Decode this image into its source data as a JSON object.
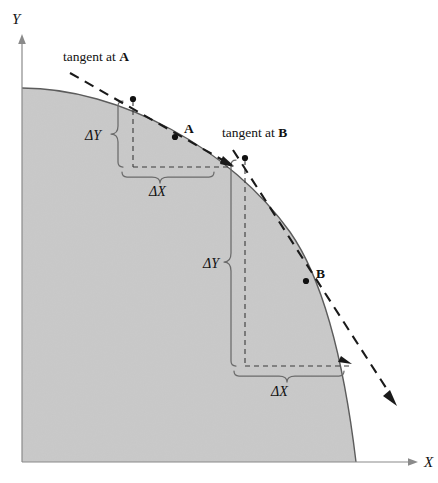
{
  "figure": {
    "background_color": "#ffffff",
    "fill_color": "#c9c9c9",
    "curve_color": "#5c5c5c",
    "axis_color": "#8a8a8a",
    "tangent_color": "#1a1a1a",
    "brace_color": "#6a6a6a"
  },
  "axes": {
    "y_label": "Y",
    "x_label": "X",
    "origin": {
      "x": 22,
      "y": 462
    },
    "y_axis_top": {
      "x": 22,
      "y": 37
    },
    "x_axis_right": {
      "x": 418,
      "y": 462
    }
  },
  "curve": {
    "name": "frontier-curve",
    "start": {
      "x": 22,
      "y": 88
    },
    "end": {
      "x": 356,
      "y": 462
    },
    "shape": "concave"
  },
  "annotations": {
    "tangent_a": {
      "label_prefix": "tangent at ",
      "label_point": "A",
      "label_x": 63,
      "label_y": 61,
      "line_start": {
        "x": 70,
        "y": 73
      },
      "line_end": {
        "x": 232,
        "y": 165
      },
      "touch_point": {
        "x": 133,
        "y": 99
      }
    },
    "tangent_b": {
      "label_prefix": "tangent at ",
      "label_point": "B",
      "label_x": 222,
      "label_y": 137,
      "line_start": {
        "x": 233,
        "y": 150
      },
      "line_end": {
        "x": 396,
        "y": 404
      },
      "touch_point": {
        "x": 245,
        "y": 158
      }
    },
    "point_a": {
      "label": "A",
      "dot": {
        "x": 175,
        "y": 137
      },
      "label_x": 184,
      "label_y": 129
    },
    "point_b": {
      "label": "B",
      "dot": {
        "x": 306,
        "y": 281
      },
      "label_x": 316,
      "label_y": 274
    }
  },
  "deltas": [
    {
      "id": "delta-a",
      "y_label": "ΔY",
      "x_label": "ΔX",
      "y_label_x": 85,
      "y_label_y": 135,
      "x_label_x": 150,
      "x_label_y": 192,
      "vertical_from": {
        "x": 133,
        "y": 99
      },
      "vertical_to": {
        "x": 133,
        "y": 166
      },
      "horizontal_from": {
        "x": 133,
        "y": 166
      },
      "horizontal_to": {
        "x": 230,
        "y": 166
      }
    },
    {
      "id": "delta-b",
      "y_label": "ΔY",
      "x_label": "ΔX",
      "y_label_x": 203,
      "y_label_y": 263,
      "x_label_x": 272,
      "x_label_y": 392,
      "vertical_from": {
        "x": 245,
        "y": 158
      },
      "vertical_to": {
        "x": 245,
        "y": 365
      },
      "horizontal_from": {
        "x": 245,
        "y": 365
      },
      "horizontal_to": {
        "x": 350,
        "y": 365
      }
    }
  ]
}
